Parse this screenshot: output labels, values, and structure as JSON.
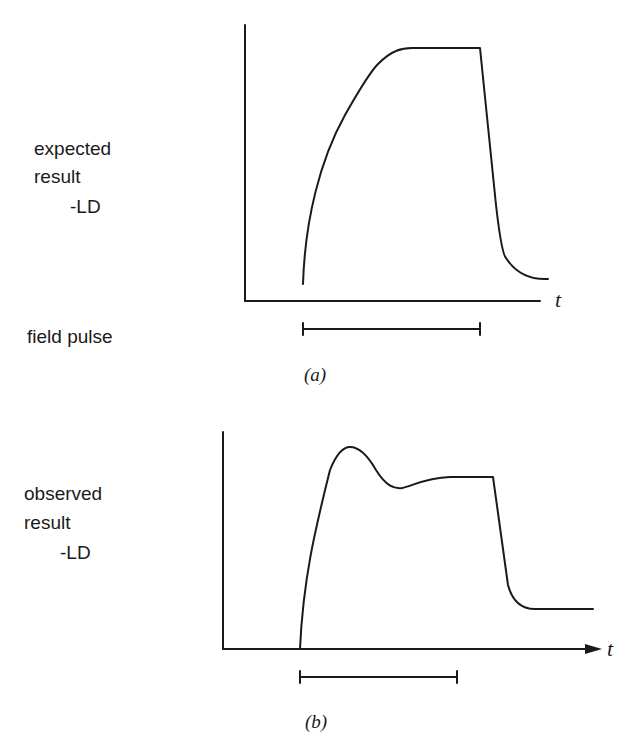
{
  "panel_a": {
    "ylabel_lines": [
      "expected",
      "result",
      "-LD"
    ],
    "pulse_label": "field pulse",
    "axis_label": "t",
    "caption": "(a)"
  },
  "panel_b": {
    "ylabel_lines": [
      "observed",
      "result",
      "-LD"
    ],
    "axis_label": "t",
    "caption": "(b)"
  },
  "colors": {
    "ink": "#1a1a1a",
    "background": "#ffffff"
  }
}
